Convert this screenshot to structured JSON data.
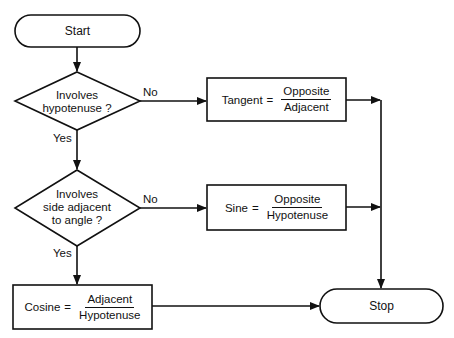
{
  "diagram": {
    "type": "flowchart",
    "nodes": {
      "start": {
        "label": "Start",
        "shape": "terminal"
      },
      "decision1": {
        "line1": "Involves",
        "line2": "hypotenuse ?",
        "shape": "diamond"
      },
      "decision2": {
        "line1": "Involves",
        "line2": "side adjacent",
        "line3": "to angle ?",
        "shape": "diamond"
      },
      "tangent": {
        "name": "Tangent",
        "equals": "=",
        "numerator": "Opposite",
        "denominator": "Adjacent",
        "shape": "process"
      },
      "sine": {
        "name": "Sine",
        "equals": "=",
        "numerator": "Opposite",
        "denominator": "Hypotenuse",
        "shape": "process"
      },
      "cosine": {
        "name": "Cosine",
        "equals": "=",
        "numerator": "Adjacent",
        "denominator": "Hypotenuse",
        "shape": "process"
      },
      "stop": {
        "label": "Stop",
        "shape": "terminal"
      }
    },
    "edges": {
      "d1_no": "No",
      "d1_yes": "Yes",
      "d2_no": "No",
      "d2_yes": "Yes"
    },
    "colors": {
      "stroke": "#111111",
      "background": "#ffffff"
    }
  }
}
